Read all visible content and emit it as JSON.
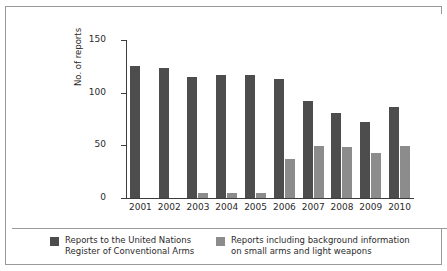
{
  "chart_data": {
    "type": "bar",
    "title": "",
    "subtitle": "",
    "xlabel": "",
    "ylabel": "No. of reports",
    "categories": [
      "2001",
      "2002",
      "2003",
      "2004",
      "2005",
      "2006",
      "2007",
      "2008",
      "2009",
      "2010"
    ],
    "series": [
      {
        "name": "Reports to the United Nations\nRegister of Conventional Arms",
        "color": "#4d4d4d",
        "values": [
          125,
          123,
          115,
          117,
          117,
          113,
          92,
          81,
          72,
          86
        ]
      },
      {
        "name": "Reports including background information\non small arms and light weapons",
        "color": "#8c8c8c",
        "values": [
          0,
          0,
          5,
          5,
          5,
          37,
          49,
          48,
          43,
          49
        ]
      }
    ],
    "ylim": [
      0,
      150
    ],
    "yticks": [
      0,
      50,
      100,
      150
    ],
    "ytick_labels": [
      "0",
      "50",
      "100",
      "150"
    ],
    "grid": false,
    "legend_position": "bottom"
  },
  "axes": {
    "y_title": "No. of reports",
    "y_ticks": [
      {
        "label": "150",
        "value": 150
      },
      {
        "label": "100",
        "value": 100
      },
      {
        "label": "50",
        "value": 50
      },
      {
        "label": "0",
        "value": 0
      }
    ],
    "x_labels": [
      "2001",
      "2002",
      "2003",
      "2004",
      "2005",
      "2006",
      "2007",
      "2008",
      "2009",
      "2010"
    ]
  },
  "legend": {
    "entries": [
      {
        "label": "Reports to the United Nations\nRegister of Conventional Arms",
        "color": "#4d4d4d"
      },
      {
        "label": "Reports including background information\non small arms and light weapons",
        "color": "#8c8c8c"
      }
    ]
  },
  "colors": {
    "series_dark": "#4d4d4d",
    "series_light": "#8c8c8c",
    "frame": "#9a9a9a",
    "axis": "#3c3c3c",
    "text": "#2b2b2b",
    "background": "#ffffff"
  }
}
